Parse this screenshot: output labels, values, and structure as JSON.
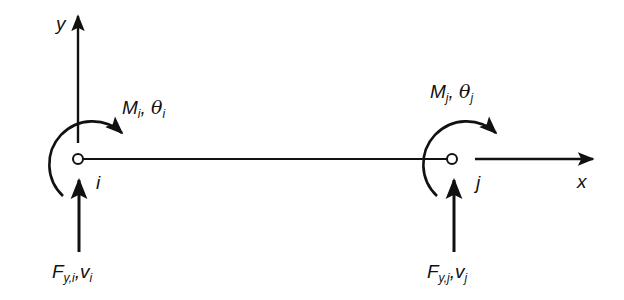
{
  "figure": {
    "axes": {
      "x_label": "x",
      "y_label": "y"
    },
    "nodes": [
      {
        "id": "i",
        "label": "i",
        "moment": {
          "symbol": "M",
          "sub": "i",
          "rotation_symbol": "θ",
          "rotation_sub": "i"
        },
        "force": {
          "symbol": "F",
          "sub": "y,i",
          "disp_symbol": "v",
          "disp_sub": "i"
        }
      },
      {
        "id": "j",
        "label": "j",
        "moment": {
          "symbol": "M",
          "sub": "j",
          "rotation_symbol": "θ",
          "rotation_sub": "j"
        },
        "force": {
          "symbol": "F",
          "sub": "y,j",
          "disp_symbol": "v",
          "disp_sub": "j"
        }
      }
    ],
    "separator": ", ",
    "force_separator": ",",
    "colors": {
      "stroke": "#111111",
      "background": "#ffffff"
    }
  }
}
